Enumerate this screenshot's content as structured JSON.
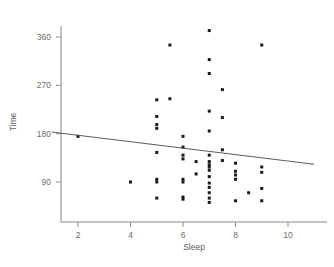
{
  "chart_data": {
    "type": "scatter",
    "title": "",
    "xlabel": "Sleep",
    "ylabel": "Time",
    "xlim": [
      1,
      11
    ],
    "ylim": [
      30,
      390
    ],
    "grid": false,
    "legend": null,
    "xticks": [
      "2",
      "4",
      "6",
      "8",
      "10"
    ],
    "xtick_values": [
      2,
      4,
      6,
      8,
      10
    ],
    "yticks": [
      "90",
      "180",
      "270",
      "360"
    ],
    "ytick_values": [
      90,
      180,
      270,
      360
    ],
    "marker": "square",
    "marker_color": "#1a1a1a",
    "series": [
      {
        "name": "observations",
        "points": [
          [
            2.0,
            175
          ],
          [
            4.0,
            90
          ],
          [
            5.0,
            243
          ],
          [
            5.0,
            212
          ],
          [
            5.0,
            197
          ],
          [
            5.0,
            190
          ],
          [
            5.0,
            145
          ],
          [
            5.0,
            95
          ],
          [
            5.0,
            90
          ],
          [
            5.0,
            60
          ],
          [
            5.5,
            345
          ],
          [
            5.5,
            245
          ],
          [
            6.0,
            175
          ],
          [
            6.0,
            155
          ],
          [
            6.0,
            140
          ],
          [
            6.0,
            133
          ],
          [
            6.0,
            95
          ],
          [
            6.0,
            90
          ],
          [
            6.0,
            62
          ],
          [
            6.0,
            58
          ],
          [
            6.5,
            128
          ],
          [
            6.5,
            105
          ],
          [
            7.0,
            372
          ],
          [
            7.0,
            318
          ],
          [
            7.0,
            292
          ],
          [
            7.0,
            222
          ],
          [
            7.0,
            185
          ],
          [
            7.0,
            140
          ],
          [
            7.0,
            128
          ],
          [
            7.0,
            122
          ],
          [
            7.0,
            118
          ],
          [
            7.0,
            112
          ],
          [
            7.0,
            100
          ],
          [
            7.0,
            88
          ],
          [
            7.0,
            80
          ],
          [
            7.0,
            70
          ],
          [
            7.0,
            60
          ],
          [
            7.0,
            52
          ],
          [
            7.5,
            262
          ],
          [
            7.5,
            210
          ],
          [
            7.5,
            150
          ],
          [
            7.5,
            130
          ],
          [
            8.0,
            125
          ],
          [
            8.0,
            110
          ],
          [
            8.0,
            103
          ],
          [
            8.0,
            95
          ],
          [
            8.0,
            55
          ],
          [
            8.5,
            70
          ],
          [
            9.0,
            345
          ],
          [
            9.0,
            118
          ],
          [
            9.0,
            108
          ],
          [
            9.0,
            78
          ],
          [
            9.0,
            55
          ]
        ]
      }
    ],
    "fit_line": {
      "name": "regression-line",
      "x_start": 1.0,
      "y_start": 183,
      "x_end": 11.0,
      "y_end": 123
    }
  }
}
